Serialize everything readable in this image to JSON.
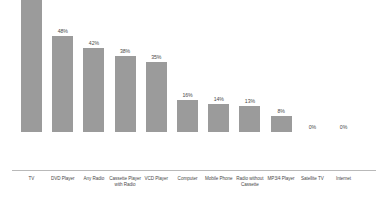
{
  "chart_data": {
    "type": "bar",
    "title": "",
    "subtitle": "",
    "xlabel": "",
    "ylabel": "",
    "ylim": [
      0,
      80
    ],
    "grid": false,
    "legend": "none",
    "orientation": "vertical",
    "bar_color": "#9b9b9b",
    "axis_color": "#b9b9b9",
    "label_color": "#4a4a4a",
    "categories": [
      "TV",
      "DVD Player",
      "Any Radio",
      "Cassette Player with Radio",
      "VCD Player",
      "Computer",
      "Mobile Phone",
      "Radio without Cassette",
      "MP3/4 Player",
      "Satellite TV",
      "Internet"
    ],
    "values": [
      74,
      48,
      42,
      38,
      35,
      16,
      14,
      13,
      8,
      0,
      0
    ],
    "value_labels": [
      "74%",
      "48%",
      "42%",
      "38%",
      "35%",
      "16%",
      "14%",
      "13%",
      "8%",
      "0%",
      "0%"
    ]
  }
}
